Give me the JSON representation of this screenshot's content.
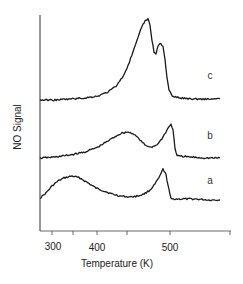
{
  "chart_data": {
    "type": "line",
    "title": "",
    "xlabel": "Temperature (K)",
    "ylabel": "NO Signal",
    "x_ticks": [
      {
        "label": "300",
        "px": 52
      },
      {
        "label": "",
        "px": 73
      },
      {
        "label": "400",
        "px": 97
      },
      {
        "label": "",
        "px": 127
      },
      {
        "label": "500",
        "px": 170
      },
      {
        "label": "",
        "px": 230
      }
    ],
    "grid": false,
    "legend": "inline labels at right of each trace",
    "series": [
      {
        "name": "a",
        "label_pos": [
          210,
          184
        ],
        "points": [
          [
            40,
            198
          ],
          [
            46,
            193
          ],
          [
            52,
            186
          ],
          [
            58,
            181
          ],
          [
            64,
            178
          ],
          [
            72,
            176
          ],
          [
            80,
            178
          ],
          [
            88,
            183
          ],
          [
            96,
            188
          ],
          [
            104,
            191
          ],
          [
            112,
            194
          ],
          [
            120,
            196
          ],
          [
            130,
            197
          ],
          [
            138,
            196
          ],
          [
            144,
            194
          ],
          [
            150,
            190
          ],
          [
            155,
            184
          ],
          [
            160,
            176
          ],
          [
            163,
            169
          ],
          [
            166,
            175
          ],
          [
            169,
            190
          ],
          [
            171,
            199
          ],
          [
            180,
            199
          ],
          [
            195,
            199
          ],
          [
            210,
            200
          ],
          [
            220,
            200
          ]
        ]
      },
      {
        "name": "b",
        "label_pos": [
          210,
          139
        ],
        "points": [
          [
            40,
            158
          ],
          [
            55,
            157
          ],
          [
            70,
            155
          ],
          [
            85,
            152
          ],
          [
            98,
            147
          ],
          [
            108,
            141
          ],
          [
            116,
            136
          ],
          [
            122,
            133
          ],
          [
            128,
            132
          ],
          [
            134,
            134
          ],
          [
            140,
            140
          ],
          [
            146,
            146
          ],
          [
            152,
            147
          ],
          [
            158,
            144
          ],
          [
            163,
            137
          ],
          [
            167,
            130
          ],
          [
            171,
            124
          ],
          [
            173,
            130
          ],
          [
            175,
            148
          ],
          [
            177,
            156
          ],
          [
            190,
            157
          ],
          [
            205,
            158
          ],
          [
            220,
            158
          ]
        ]
      },
      {
        "name": "c",
        "label_pos": [
          210,
          79
        ],
        "points": [
          [
            40,
            100
          ],
          [
            55,
            100
          ],
          [
            70,
            99
          ],
          [
            85,
            98
          ],
          [
            98,
            96
          ],
          [
            108,
            92
          ],
          [
            116,
            86
          ],
          [
            122,
            78
          ],
          [
            128,
            66
          ],
          [
            133,
            52
          ],
          [
            138,
            38
          ],
          [
            142,
            26
          ],
          [
            145,
            21
          ],
          [
            148,
            19
          ],
          [
            150,
            25
          ],
          [
            152,
            40
          ],
          [
            154,
            52
          ],
          [
            156,
            54
          ],
          [
            158,
            46
          ],
          [
            160,
            43
          ],
          [
            163,
            46
          ],
          [
            165,
            60
          ],
          [
            167,
            78
          ],
          [
            169,
            90
          ],
          [
            172,
            96
          ],
          [
            180,
            98
          ],
          [
            195,
            99
          ],
          [
            210,
            99
          ],
          [
            220,
            99
          ]
        ]
      }
    ]
  },
  "axes": {
    "xlabel": "Temperature (K)",
    "ylabel": "NO Signal",
    "tick_300": "300",
    "tick_400": "400",
    "tick_500": "500"
  },
  "labels": {
    "a": "a",
    "b": "b",
    "c": "c"
  }
}
